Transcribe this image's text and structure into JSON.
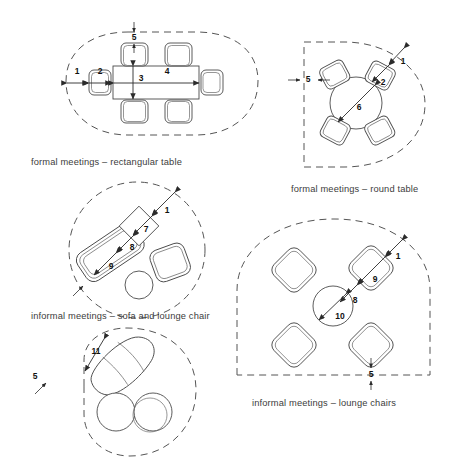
{
  "figure": {
    "background_color": "#ffffff",
    "line_color": "#4a4a4a",
    "zone_color": "#555555",
    "dimension_color": "#2b2b2b"
  },
  "diagrams": [
    {
      "id": "formal-rectangular",
      "caption": "formal meetings – rectangular table",
      "zone_shape": "rounded-oval",
      "table": "rectangular",
      "chair_count": 6,
      "dimensions": [
        {
          "key": "1",
          "label": "1",
          "orientation": "horizontal",
          "meaning": "overall width to zone edge"
        },
        {
          "key": "2",
          "label": "2",
          "orientation": "horizontal",
          "meaning": "chair depth"
        },
        {
          "key": "3",
          "label": "3",
          "orientation": "vertical",
          "meaning": "table depth"
        },
        {
          "key": "4",
          "label": "4",
          "orientation": "horizontal",
          "meaning": "table length"
        },
        {
          "key": "5",
          "label": "5",
          "orientation": "vertical",
          "meaning": "clearance to zone edge"
        }
      ]
    },
    {
      "id": "formal-round",
      "caption": "formal meetings – round table",
      "zone_shape": "circle-flat-left",
      "table": "round",
      "chair_count": 4,
      "dimensions": [
        {
          "key": "1",
          "label": "1",
          "orientation": "diagonal",
          "meaning": "overall diagonal to zone edge"
        },
        {
          "key": "2",
          "label": "2",
          "orientation": "diagonal",
          "meaning": "chair depth"
        },
        {
          "key": "5",
          "label": "5",
          "orientation": "horizontal",
          "meaning": "clearance to zone edge"
        },
        {
          "key": "6",
          "label": "6",
          "orientation": "diagonal",
          "meaning": "table diameter"
        }
      ]
    },
    {
      "id": "informal-sofa",
      "caption": "informal meetings – sofa and lounge chair",
      "zone_shape": "circle",
      "table": "square-and-round",
      "chair_count": 3,
      "dimensions": [
        {
          "key": "1",
          "label": "1",
          "orientation": "diagonal",
          "meaning": "overall diagonal to zone edge"
        },
        {
          "key": "7",
          "label": "7",
          "orientation": "diagonal",
          "meaning": "side table size"
        },
        {
          "key": "8",
          "label": "8",
          "orientation": "diagonal",
          "meaning": "gap between sofa and table"
        },
        {
          "key": "9",
          "label": "9",
          "orientation": "diagonal",
          "meaning": "sofa depth"
        }
      ]
    },
    {
      "id": "informal-lounge",
      "caption": "informal meetings – lounge chairs",
      "zone_shape": "circle-flat-bottom",
      "table": "round",
      "chair_count": 4,
      "dimensions": [
        {
          "key": "1",
          "label": "1",
          "orientation": "diagonal",
          "meaning": "overall diagonal to zone edge"
        },
        {
          "key": "5",
          "label": "5",
          "orientation": "vertical",
          "meaning": "clearance to zone edge"
        },
        {
          "key": "8",
          "label": "8",
          "orientation": "diagonal",
          "meaning": "gap between chair and table"
        },
        {
          "key": "9",
          "label": "9",
          "orientation": "diagonal",
          "meaning": "lounge chair depth"
        },
        {
          "key": "10",
          "label": "10",
          "orientation": "diagonal",
          "meaning": "round table diameter"
        }
      ]
    },
    {
      "id": "informal-curved",
      "caption": "",
      "zone_shape": "rounded-blob",
      "table": "two-round",
      "chair_count": 1,
      "dimensions": [
        {
          "key": "11",
          "label": "11",
          "orientation": "diagonal",
          "meaning": "curved sofa length"
        },
        {
          "key": "5",
          "label": "5",
          "orientation": "diagonal",
          "meaning": "clearance to zone edge"
        }
      ]
    }
  ],
  "labels": {
    "d1": "1",
    "d2": "2",
    "d3": "3",
    "d4": "4",
    "d5": "5",
    "d5b": "5",
    "d5c": "5",
    "d5d": "5",
    "d6": "6",
    "d7": "7",
    "d8": "8",
    "d8b": "8",
    "d9": "9",
    "d9b": "9",
    "d10": "10",
    "d11": "11",
    "d1b": "1",
    "d1c": "1",
    "d1d": "1"
  },
  "captions": {
    "rect": "formal meetings – rectangular table",
    "round": "formal meetings – round table",
    "sofa": "informal meetings – sofa and lounge chair",
    "lounge": "informal meetings – lounge chairs"
  }
}
